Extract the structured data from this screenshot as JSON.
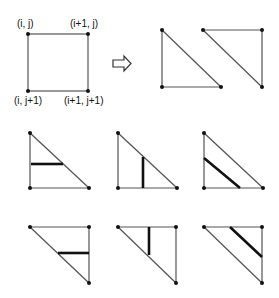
{
  "labels": {
    "top_left": "(i, j)",
    "top_right": "(i+1, j)",
    "bottom_left": "(i, j+1)",
    "bottom_right": "(i+1, j+1)"
  },
  "figure": {
    "square": {
      "x1": 28,
      "y1": 34,
      "x2": 88,
      "y2": 91
    },
    "arrow": "right-hollow-arrow",
    "split_triangles": [
      {
        "name": "lower-left-triangle",
        "points": [
          [
            162,
            30
          ],
          [
            162,
            87
          ],
          [
            221,
            87
          ]
        ]
      },
      {
        "name": "upper-right-triangle",
        "points": [
          [
            203,
            30
          ],
          [
            262,
            30
          ],
          [
            262,
            87
          ]
        ]
      }
    ],
    "rows": [
      {
        "name": "lower-left-cases",
        "triangles": [
          {
            "points": [
              [
                30,
                133
              ],
              [
                30,
                188
              ],
              [
                89,
                188
              ]
            ],
            "segment": [
              [
                31,
                164
              ],
              [
                63,
                164
              ]
            ],
            "segment_type": "horizontal"
          },
          {
            "points": [
              [
                118,
                133
              ],
              [
                118,
                188
              ],
              [
                177,
                188
              ]
            ],
            "segment": [
              [
                143,
                157
              ],
              [
                143,
                188
              ]
            ],
            "segment_type": "vertical"
          },
          {
            "points": [
              [
                204,
                133
              ],
              [
                204,
                188
              ],
              [
                263,
                188
              ]
            ],
            "segment": [
              [
                204,
                158
              ],
              [
                240,
                188
              ]
            ],
            "segment_type": "diagonal"
          }
        ]
      },
      {
        "name": "upper-right-cases",
        "triangles": [
          {
            "points": [
              [
                30,
                227
              ],
              [
                89,
                227
              ],
              [
                89,
                283
              ]
            ],
            "segment": [
              [
                58,
                253
              ],
              [
                89,
                253
              ]
            ],
            "segment_type": "horizontal"
          },
          {
            "points": [
              [
                118,
                227
              ],
              [
                176,
                227
              ],
              [
                176,
                283
              ]
            ],
            "segment": [
              [
                149,
                227
              ],
              [
                149,
                255
              ]
            ],
            "segment_type": "vertical"
          },
          {
            "points": [
              [
                204,
                227
              ],
              [
                262,
                227
              ],
              [
                262,
                283
              ]
            ],
            "segment": [
              [
                230,
                227
              ],
              [
                262,
                257
              ]
            ],
            "segment_type": "diagonal"
          }
        ]
      }
    ]
  }
}
